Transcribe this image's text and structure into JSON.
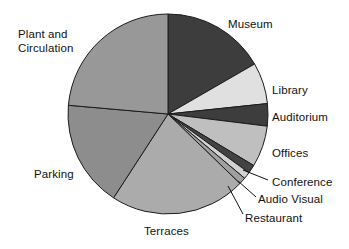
{
  "chart_data": {
    "type": "pie",
    "title": "",
    "subtitle": "",
    "xlabel": "",
    "ylabel": "",
    "legend_position": "none",
    "grid": false,
    "labels_mode": "outside-with-leader-lines",
    "start_angle_deg": 0,
    "direction": "clockwise",
    "center": {
      "x": 168,
      "y": 114
    },
    "radius": 100,
    "categories": [
      "Museum",
      "Library",
      "Auditorium",
      "Offices",
      "Conference",
      "Audio Visual",
      "Restaurant",
      "Terraces",
      "Parking",
      "Plant and Circulation"
    ],
    "values": [
      16.7,
      6.7,
      3.6,
      6.7,
      1.4,
      1.1,
      1.1,
      22.0,
      17.2,
      23.5
    ],
    "slices": [
      {
        "label": "Museum",
        "value": 16.7,
        "start_deg": 0,
        "end_deg": 60,
        "color": "#3d3d3d"
      },
      {
        "label": "Library",
        "value": 6.7,
        "start_deg": 60,
        "end_deg": 84,
        "color": "#e0e0e0"
      },
      {
        "label": "Auditorium",
        "value": 3.6,
        "start_deg": 84,
        "end_deg": 97,
        "color": "#3d3d3d"
      },
      {
        "label": "Offices",
        "value": 6.7,
        "start_deg": 97,
        "end_deg": 121,
        "color": "#bfbfbf"
      },
      {
        "label": "Conference",
        "value": 1.4,
        "start_deg": 121,
        "end_deg": 126,
        "color": "#434343"
      },
      {
        "label": "Audio Visual",
        "value": 1.1,
        "start_deg": 126,
        "end_deg": 130,
        "color": "#d2d2d2"
      },
      {
        "label": "Restaurant",
        "value": 1.1,
        "start_deg": 130,
        "end_deg": 134,
        "color": "#a0a0a0"
      },
      {
        "label": "Terraces",
        "value": 22.0,
        "start_deg": 134,
        "end_deg": 213,
        "color": "#ababab"
      },
      {
        "label": "Parking",
        "value": 17.2,
        "start_deg": 213,
        "end_deg": 275,
        "color": "#8d8d8d"
      },
      {
        "label": "Plant and Circulation",
        "value": 23.5,
        "start_deg": 275,
        "end_deg": 360,
        "color": "#989898"
      }
    ],
    "annotations": [
      {
        "text": "Museum",
        "x": 228,
        "y": 18,
        "align": "left",
        "lines": [
          "Museum"
        ],
        "leader": null
      },
      {
        "text": "Library",
        "x": 272,
        "y": 84,
        "align": "left",
        "lines": [
          "Library"
        ],
        "leader": null
      },
      {
        "text": "Auditorium",
        "x": 272,
        "y": 111,
        "align": "left",
        "lines": [
          "Auditorium"
        ],
        "leader": null
      },
      {
        "text": "Offices",
        "x": 272,
        "y": 147,
        "align": "left",
        "lines": [
          "Offices"
        ],
        "leader": null
      },
      {
        "text": "Conference",
        "x": 272,
        "y": 176,
        "align": "left",
        "lines": [
          "Conference"
        ],
        "leader": {
          "x1": 268,
          "y1": 180,
          "x2": 243,
          "y2": 170
        }
      },
      {
        "text": "Audio Visual",
        "x": 258,
        "y": 193,
        "align": "left",
        "lines": [
          "Audio Visual"
        ],
        "leader": {
          "x1": 256,
          "y1": 197,
          "x2": 238,
          "y2": 181
        }
      },
      {
        "text": "Restaurant",
        "x": 245,
        "y": 212,
        "align": "left",
        "lines": [
          "Restaurant"
        ],
        "leader": {
          "x1": 243,
          "y1": 214,
          "x2": 228,
          "y2": 186
        }
      },
      {
        "text": "Terraces",
        "x": 144,
        "y": 225,
        "align": "left",
        "lines": [
          "Terraces"
        ],
        "leader": null
      },
      {
        "text": "Parking",
        "x": 34,
        "y": 168,
        "align": "left",
        "lines": [
          "Parking"
        ],
        "leader": null
      },
      {
        "text": "Plant and Circulation",
        "x": 18,
        "y": 28,
        "align": "left",
        "lines": [
          "Plant and",
          "Circulation"
        ],
        "leader": null
      }
    ]
  }
}
